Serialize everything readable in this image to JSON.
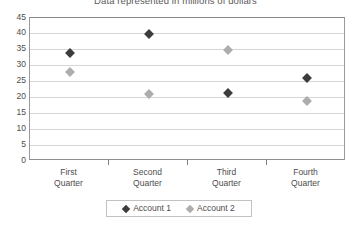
{
  "chart_data": {
    "type": "scatter",
    "title": "Data represented in millions of dollars",
    "xlabel": "",
    "ylabel": "",
    "categories": [
      "First Quarter",
      "Second Quarter",
      "Third Quarter",
      "Fourth Quarter"
    ],
    "category_lines": [
      [
        "First",
        "Quarter"
      ],
      [
        "Second",
        "Quarter"
      ],
      [
        "Third",
        "Quarter"
      ],
      [
        "Fourth",
        "Quarter"
      ]
    ],
    "series": [
      {
        "name": "Account 1",
        "color": "#3c3c3c",
        "marker": "diamond",
        "values": [
          34,
          40,
          21.5,
          26
        ]
      },
      {
        "name": "Account 2",
        "color": "#adadad",
        "marker": "diamond",
        "values": [
          28,
          21,
          35,
          19
        ]
      }
    ],
    "ylim": [
      0,
      45
    ],
    "ytick_step": 5,
    "yticks": [
      45,
      40,
      35,
      30,
      25,
      20,
      15,
      10,
      5,
      0
    ],
    "grid": true,
    "grid_axis": "y",
    "legend": {
      "position": "bottom",
      "entries": [
        "Account 1",
        "Account 2"
      ]
    }
  },
  "colors": {
    "series1": "#3c3c3c",
    "series2": "#adadad",
    "gridline": "#d6d6d6",
    "frame": "#9a9a9a",
    "text": "#4d4d4d",
    "background": "#ffffff"
  }
}
